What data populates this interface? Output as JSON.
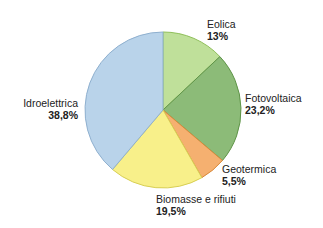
{
  "chart_data": {
    "type": "pie",
    "title": "",
    "categories": [
      "Eolica",
      "Fotovoltaica",
      "Geotermica",
      "Biomasse e rifiuti",
      "Idroelettrica"
    ],
    "values": [
      13,
      23.2,
      5.5,
      19.5,
      38.8
    ],
    "value_labels": [
      "13%",
      "23,2%",
      "5,5%",
      "19,5%",
      "38,8%"
    ],
    "colors": [
      "#bfe09a",
      "#8cbb78",
      "#f5b070",
      "#f8f08a",
      "#b9d3ea"
    ],
    "start_angle_deg": 0,
    "direction": "clockwise",
    "legend": "none (direct labels)"
  },
  "labels": {
    "eolica": {
      "name": "Eolica",
      "value": "13%"
    },
    "fotovoltaica": {
      "name": "Fotovoltaica",
      "value": "23,2%"
    },
    "geotermica": {
      "name": "Geotermica",
      "value": "5,5%"
    },
    "biomasse": {
      "name": "Biomasse e rifiuti",
      "value": "19,5%"
    },
    "idroelettrica": {
      "name": "Idroelettrica",
      "value": "38,8%"
    }
  }
}
